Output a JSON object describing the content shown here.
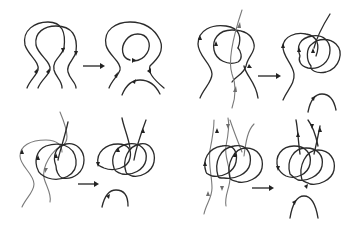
{
  "figure": {
    "type": "diagram",
    "background": "#ffffff",
    "line_color": "#2b2b2b",
    "secondary_line_color": "#7a7a7a",
    "panels": [
      {
        "id": "top-left",
        "before": "three parallel overlapping arched loops with upward arrows",
        "after": "one large loop enclosing a closed circular loop plus a detached lower arc"
      },
      {
        "id": "top-right",
        "before": "two interlinked loops crossed by a straight grey field line",
        "after": "two loops linked with a straight line plus a detached lower arc"
      },
      {
        "id": "bottom-left",
        "before": "two interlocked loops crossed by grey field lines",
        "after": "three linked loops with an upward line plus a detached lower arc"
      },
      {
        "id": "bottom-right",
        "before": "three interlocked loops crossed by multiple grey field lines",
        "after": "a bundle of linked loops with lines and a detached lower arc"
      }
    ],
    "transition_symbol": "→"
  }
}
